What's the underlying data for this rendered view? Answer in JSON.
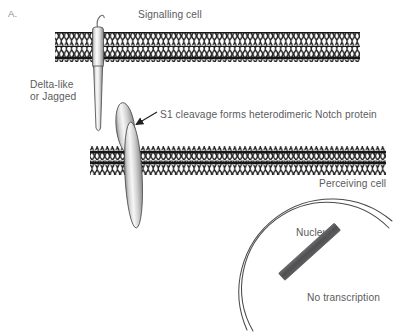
{
  "figure": {
    "panel_label": "A.",
    "topic": "Notch signalling between two cells",
    "background_color": "#ffffff",
    "text_color": "#5b5b5d"
  },
  "labels": {
    "signalling_cell": "Signalling cell",
    "ligand_line1": "Delta-like",
    "ligand_line2": "or Jagged",
    "s1_cleavage": "S1 cleavage forms heterodimeric Notch protein",
    "perceiving_cell": "Perceiving cell",
    "nucleus": "Nucleus",
    "no_transcription": "No transcription"
  },
  "caption": {
    "cropped_line": ""
  },
  "membranes": [
    {
      "name": "signalling-cell-membrane",
      "x": 55,
      "y": 32,
      "width": 305,
      "height": 30,
      "leaflets": 2,
      "head_color": "#1a1a1a",
      "tail_color": "#2b2b2b"
    },
    {
      "name": "perceiving-cell-membrane",
      "x": 90,
      "y": 146,
      "width": 296,
      "height": 29,
      "leaflets": 2,
      "head_color": "#1a1a1a",
      "tail_color": "#2b2b2b"
    }
  ],
  "proteins": [
    {
      "name": "delta-jagged-ligand",
      "label": "Delta-like or Jagged",
      "cell": "signalling",
      "shape": "tapered-rod-with-hook",
      "fill_light": "#f2f2f2",
      "fill_dark": "#9b9b9b",
      "stroke": "#4d4d4d"
    },
    {
      "name": "notch-extracellular-subunit",
      "label": "Notch extracellular subunit",
      "cell": "perceiving",
      "shape": "lens",
      "fill_light": "#f0f0f0",
      "fill_dark": "#9a9a9a",
      "stroke": "#4d4d4d"
    },
    {
      "name": "notch-transmembrane-subunit",
      "label": "Notch transmembrane subunit",
      "cell": "perceiving",
      "shape": "lens",
      "fill_light": "#f0f0f0",
      "fill_dark": "#9a9a9a",
      "stroke": "#4d4d4d"
    }
  ],
  "nucleus": {
    "name": "nucleus",
    "label": "Nucleus",
    "envelope_arcs": 2,
    "stroke": "#4a4a4a",
    "stroke_width": 1.1
  },
  "dna": {
    "name": "dna-strand",
    "label": "No transcription",
    "color": "#555557",
    "angle_deg": -42
  },
  "annotation_arrow": {
    "name": "s1-cleavage-arrow",
    "points_to": "notch-extracellular-subunit",
    "color": "#1f1f1f"
  }
}
